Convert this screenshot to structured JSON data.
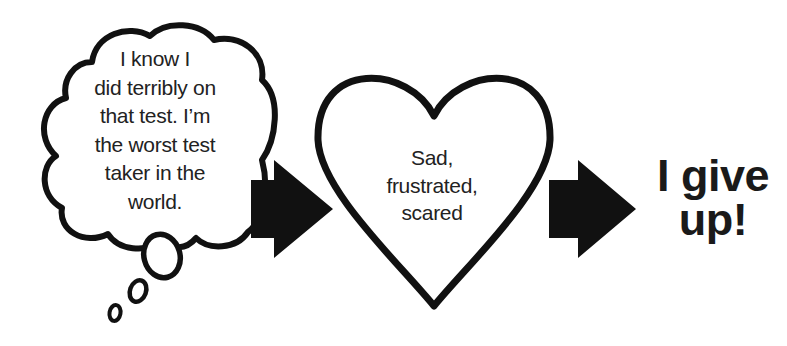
{
  "diagram": {
    "type": "flow",
    "stages": [
      {
        "id": "thought",
        "shape": "thought-cloud",
        "lines": [
          "I know I",
          "did terribly on",
          "that test. I’m",
          "the worst test",
          "taker in the",
          "world."
        ]
      },
      {
        "id": "feeling",
        "shape": "heart",
        "lines": [
          "Sad,",
          "frustrated,",
          "scared"
        ]
      },
      {
        "id": "behavior",
        "shape": "text",
        "lines": [
          "I give",
          "up!"
        ]
      }
    ],
    "connectors": [
      {
        "from": "thought",
        "to": "feeling",
        "shape": "block-arrow-right"
      },
      {
        "from": "feeling",
        "to": "behavior",
        "shape": "block-arrow-right"
      }
    ],
    "colors": {
      "stroke": "#111111",
      "fill": "#ffffff",
      "text": "#222222"
    }
  }
}
